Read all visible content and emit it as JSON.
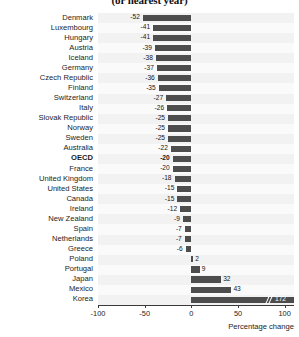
{
  "chart_data": {
    "type": "bar",
    "orientation": "horizontal",
    "title": "(or nearest year)",
    "xlabel": "Percentage change",
    "ylabel": "",
    "xlim": [
      -100,
      110
    ],
    "xticks": [
      -100,
      -50,
      0,
      50,
      100
    ],
    "xtick_labels": [
      "-100",
      "-50",
      "0",
      "50",
      "100"
    ],
    "grid": false,
    "legend": null,
    "highlight_category": "OECD",
    "categories": [
      "Denmark",
      "Luxembourg",
      "Hungary",
      "Austria",
      "Iceland",
      "Germany",
      "Czech Republic",
      "Finland",
      "Switzerland",
      "Italy",
      "Slovak Republic",
      "Norway",
      "Sweden",
      "Australia",
      "OECD",
      "France",
      "United Kingdom",
      "United States",
      "Canada",
      "Ireland",
      "New Zealand",
      "Spain",
      "Netherlands",
      "Greece",
      "Poland",
      "Portugal",
      "Japan",
      "Mexico",
      "Korea"
    ],
    "values": [
      -52,
      -41,
      -41,
      -39,
      -38,
      -37,
      -36,
      -35,
      -27,
      -26,
      -25,
      -25,
      -25,
      -22,
      -20,
      -20,
      -18,
      -15,
      -15,
      -12,
      -9,
      -7,
      -7,
      -6,
      2,
      9,
      32,
      43,
      172
    ],
    "value_labels": [
      "-52",
      "-41",
      "-41",
      "-39",
      "-38",
      "-37",
      "-36",
      "-35",
      "-27",
      "-26",
      "-25",
      "-25",
      "-25",
      "-22",
      "-20",
      "-20",
      "-18",
      "-15",
      "-15",
      "-12",
      "-9",
      "-7",
      "-7",
      "-6",
      "2",
      "9",
      "32",
      "43",
      "172"
    ],
    "truncated_bars": [
      "Korea"
    ],
    "bar_color": "#4d4d4d",
    "band_color": "#f2f2f2"
  }
}
